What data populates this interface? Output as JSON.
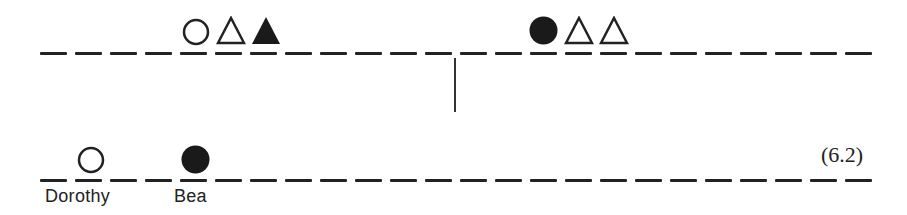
{
  "diagram": {
    "equation_number": "(6.2)",
    "top_row": {
      "line_y": 52,
      "x_start": 40,
      "dash_count": 24,
      "dash_pitch": 35,
      "left_group": [
        {
          "shape": "circle",
          "fill": "open",
          "x": 182
        },
        {
          "shape": "triangle",
          "fill": "open",
          "x": 216
        },
        {
          "shape": "triangle",
          "fill": "filled",
          "x": 251
        }
      ],
      "right_group": [
        {
          "shape": "circle",
          "fill": "filled",
          "x": 529
        },
        {
          "shape": "triangle",
          "fill": "open",
          "x": 564
        },
        {
          "shape": "triangle",
          "fill": "open",
          "x": 599
        }
      ]
    },
    "divider": {
      "x": 454,
      "y_top": 58,
      "y_bottom": 112
    },
    "bottom_row": {
      "line_y": 180,
      "x_start": 40,
      "dash_count": 24,
      "dash_pitch": 35,
      "markers": [
        {
          "shape": "circle",
          "fill": "open",
          "x": 77,
          "label": "Dorothy",
          "label_x": 45
        },
        {
          "shape": "circle",
          "fill": "filled",
          "x": 181,
          "label": "Bea",
          "label_x": 174
        }
      ]
    },
    "colors": {
      "ink": "#222222",
      "background": "#ffffff"
    }
  }
}
